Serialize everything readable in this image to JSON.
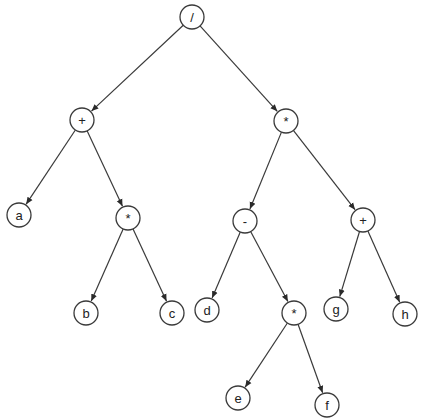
{
  "diagram": {
    "type": "expression-tree",
    "node_radius": 12,
    "colors": {
      "stroke": "#3a3a3a",
      "fill": "#ffffff",
      "text": "#222222"
    },
    "nodes": [
      {
        "id": "n1",
        "label": "/",
        "x": 192,
        "y": 17
      },
      {
        "id": "n2",
        "label": "+",
        "x": 82,
        "y": 120
      },
      {
        "id": "n3",
        "label": "*",
        "x": 286,
        "y": 121
      },
      {
        "id": "n4",
        "label": "a",
        "x": 19,
        "y": 215
      },
      {
        "id": "n5",
        "label": "*",
        "x": 128,
        "y": 218
      },
      {
        "id": "n6",
        "label": "-",
        "x": 245,
        "y": 221
      },
      {
        "id": "n7",
        "label": "+",
        "x": 363,
        "y": 220
      },
      {
        "id": "n8",
        "label": "b",
        "x": 86,
        "y": 313
      },
      {
        "id": "n9",
        "label": "c",
        "x": 172,
        "y": 313
      },
      {
        "id": "n10",
        "label": "d",
        "x": 207,
        "y": 310
      },
      {
        "id": "n11",
        "label": "*",
        "x": 294,
        "y": 313
      },
      {
        "id": "n12",
        "label": "g",
        "x": 336,
        "y": 309
      },
      {
        "id": "n13",
        "label": "h",
        "x": 405,
        "y": 314
      },
      {
        "id": "n14",
        "label": "e",
        "x": 238,
        "y": 398
      },
      {
        "id": "n15",
        "label": "f",
        "x": 327,
        "y": 405
      }
    ],
    "edges": [
      {
        "from": "n1",
        "to": "n2"
      },
      {
        "from": "n1",
        "to": "n3"
      },
      {
        "from": "n2",
        "to": "n4"
      },
      {
        "from": "n2",
        "to": "n5"
      },
      {
        "from": "n5",
        "to": "n8"
      },
      {
        "from": "n5",
        "to": "n9"
      },
      {
        "from": "n3",
        "to": "n6"
      },
      {
        "from": "n3",
        "to": "n7"
      },
      {
        "from": "n6",
        "to": "n10"
      },
      {
        "from": "n6",
        "to": "n11"
      },
      {
        "from": "n7",
        "to": "n12"
      },
      {
        "from": "n7",
        "to": "n13"
      },
      {
        "from": "n11",
        "to": "n14"
      },
      {
        "from": "n11",
        "to": "n15"
      }
    ]
  }
}
